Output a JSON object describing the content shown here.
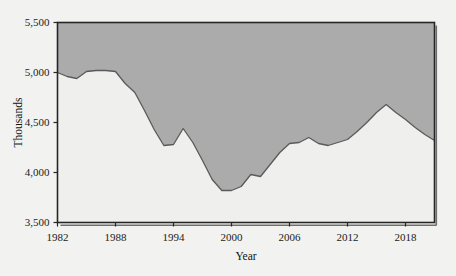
{
  "chart_data": {
    "type": "area",
    "title": "",
    "subtitle": "",
    "xlabel": "Year",
    "ylabel": "Thousands",
    "xlim": [
      1982,
      2021
    ],
    "ylim": [
      3500,
      5500
    ],
    "grid": false,
    "legend": null,
    "fill_direction": "above-line",
    "series_name": "Thousands",
    "xticks": [
      1982,
      1988,
      1994,
      2000,
      2006,
      2012,
      2018
    ],
    "xtick_labels": [
      "1982",
      "1988",
      "1994",
      "2000",
      "2006",
      "2012",
      "2018"
    ],
    "yticks": [
      3500,
      4000,
      4500,
      5000,
      5500
    ],
    "ytick_labels": [
      "3,500",
      "4,000",
      "4,500",
      "5,000",
      "5,500"
    ],
    "x": [
      1982,
      1983,
      1984,
      1985,
      1986,
      1987,
      1988,
      1989,
      1990,
      1991,
      1992,
      1993,
      1994,
      1995,
      1996,
      1997,
      1998,
      1999,
      2000,
      2001,
      2002,
      2003,
      2004,
      2005,
      2006,
      2007,
      2008,
      2009,
      2010,
      2011,
      2012,
      2013,
      2014,
      2015,
      2016,
      2017,
      2018,
      2019,
      2020,
      2021
    ],
    "values": [
      5000,
      4960,
      4940,
      5010,
      5020,
      5020,
      5010,
      4890,
      4800,
      4620,
      4430,
      4270,
      4280,
      4440,
      4300,
      4120,
      3930,
      3820,
      3820,
      3860,
      3980,
      3960,
      4080,
      4200,
      4290,
      4300,
      4350,
      4290,
      4270,
      4300,
      4330,
      4410,
      4500,
      4600,
      4680,
      4600,
      4530,
      4450,
      4380,
      4320
    ],
    "colors": {
      "fill": "#ababab",
      "line": "#5a5a5a",
      "border": "#262626",
      "background": "#f2f2f0",
      "text": "#1a1a1a"
    }
  },
  "axes": {
    "y_axis_title": "Thousands",
    "x_axis_title": "Year"
  }
}
